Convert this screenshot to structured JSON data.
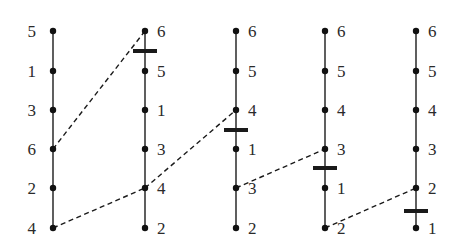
{
  "diagram": {
    "rows_y": [
      31,
      71,
      110,
      149,
      188,
      228
    ],
    "columns": [
      {
        "x": 53,
        "label_side": "left",
        "labels": [
          "5",
          "1",
          "3",
          "6",
          "2",
          "4"
        ],
        "cut_y": null
      },
      {
        "x": 145,
        "label_side": "right",
        "labels": [
          "6",
          "5",
          "1",
          "3",
          "4",
          "2"
        ],
        "cut_y": 51
      },
      {
        "x": 236,
        "label_side": "right",
        "labels": [
          "6",
          "5",
          "4",
          "1",
          "3",
          "2"
        ],
        "cut_y": 130
      },
      {
        "x": 325,
        "label_side": "right",
        "labels": [
          "6",
          "5",
          "4",
          "3",
          "1",
          "2"
        ],
        "cut_y": 168
      },
      {
        "x": 416,
        "label_side": "right",
        "labels": [
          "6",
          "5",
          "4",
          "3",
          "2",
          "1"
        ],
        "cut_y": 211
      }
    ],
    "dashed_links": [
      {
        "from": [
          0,
          3
        ],
        "to": [
          1,
          0
        ]
      },
      {
        "from": [
          0,
          5
        ],
        "to": [
          1,
          4
        ]
      },
      {
        "from": [
          1,
          4
        ],
        "to": [
          2,
          2
        ]
      },
      {
        "from": [
          2,
          4
        ],
        "to": [
          3,
          3
        ]
      },
      {
        "from": [
          3,
          5
        ],
        "to": [
          4,
          4
        ]
      }
    ],
    "colors": {
      "line": "#1a1a1a",
      "node": "#111111",
      "text": "#2a2a2a"
    }
  }
}
